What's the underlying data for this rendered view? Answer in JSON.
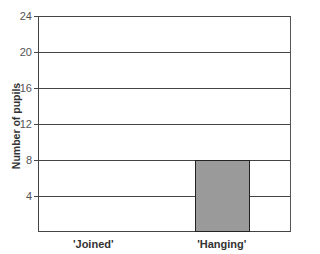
{
  "chart_data": {
    "type": "bar",
    "title": "",
    "xlabel": "",
    "ylabel": "Number of pupils",
    "categories": [
      "'Joined'",
      "'Hanging'"
    ],
    "values": [
      0,
      8
    ],
    "ylim": [
      0,
      24
    ],
    "yticks": [
      4,
      8,
      12,
      16,
      20,
      24
    ],
    "grid": true,
    "bar_color": "#9a9a9a"
  }
}
